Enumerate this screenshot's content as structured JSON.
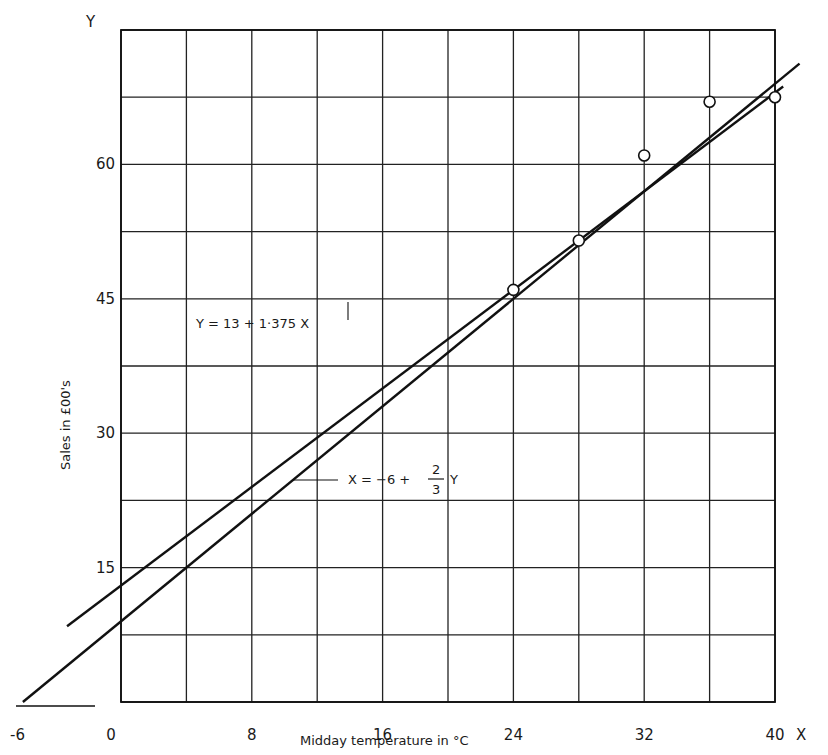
{
  "chart_data": {
    "type": "scatter",
    "title": "",
    "xlabel": "Midday temperature in °C",
    "ylabel": "Sales in £00's",
    "x_axis_letter": "X",
    "y_axis_letter": "Y",
    "xlim": [
      0,
      40
    ],
    "ylim": [
      0,
      75
    ],
    "x_ticks": [
      0,
      8,
      16,
      24,
      32,
      40
    ],
    "x_tick_labels": [
      "0",
      "8",
      "16",
      "24",
      "32",
      "40"
    ],
    "x_negative_label": "-6",
    "y_ticks": [
      15,
      30,
      45,
      60
    ],
    "y_tick_labels": [
      "15",
      "30",
      "45",
      "60"
    ],
    "grid": true,
    "grid_x_step": 4,
    "grid_y_step": 7.5,
    "legend": null,
    "series": [
      {
        "name": "Observed sales",
        "type": "scatter",
        "marker": "open-circle",
        "points": [
          {
            "x": 24,
            "y": 46
          },
          {
            "x": 28,
            "y": 51.5
          },
          {
            "x": 32,
            "y": 61
          },
          {
            "x": 36,
            "y": 67
          },
          {
            "x": 40,
            "y": 67.5
          }
        ]
      },
      {
        "name": "Regression of Y on X",
        "type": "line",
        "equation_label": "Y = 13 + 1·375 X",
        "intercept": 13,
        "slope": 1.375,
        "x_range": [
          -3.3,
          40.5
        ]
      },
      {
        "name": "Regression of X on Y",
        "type": "line",
        "equation_label": "X = −6 + ⅔ Y",
        "equation_parts": {
          "lhs": "X = −6 +",
          "frac_num": "2",
          "frac_den": "3",
          "rhs": "Y"
        },
        "x_intercept": -6,
        "slope_x_per_y": 0.6667,
        "x_range": [
          -6,
          41.5
        ]
      }
    ],
    "annotations": [
      {
        "text": "Y = 13 + 1·375 X",
        "near": [
          14,
          44
        ]
      },
      {
        "text": "X = −6 + ⅔ Y",
        "near": [
          21,
          27
        ]
      }
    ]
  }
}
